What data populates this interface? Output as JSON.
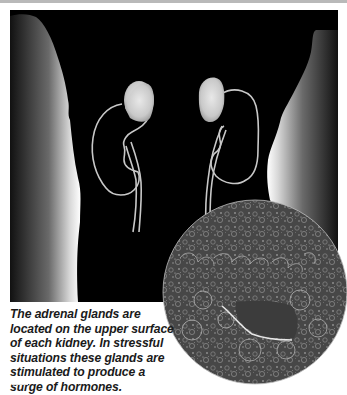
{
  "figure": {
    "caption": "The adrenal glands are located on the upper surface of each kidney. In stressful situations these glands are stimulated to produce a surge of hormones.",
    "elements": {
      "body_silhouette": "torso outline",
      "left_kidney": "left kidney with adrenal gland",
      "right_kidney": "right kidney with adrenal gland",
      "micrograph": "adrenal tissue micrograph"
    }
  },
  "colors": {
    "background_panel": "#000000",
    "body_edge": "#ffffff",
    "kidney_outline": "#c8c8c8",
    "adrenal_gland": "#d6d6d6",
    "micrograph_base": "#4a4a4a",
    "caption_text": "#1a1a1a",
    "top_rule": "#b9b9b9"
  }
}
